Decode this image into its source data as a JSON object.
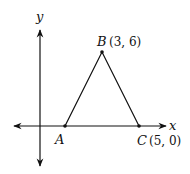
{
  "diagram": {
    "type": "coordinate-plane-triangle",
    "axes": {
      "x_label": "x",
      "y_label": "y"
    },
    "points": [
      {
        "name": "A",
        "coords_text": "",
        "px": 65,
        "py": 126
      },
      {
        "name": "B",
        "coords_text": "(3, 6)",
        "px": 102,
        "py": 52
      },
      {
        "name": "C",
        "coords_text": "(5, 0)",
        "px": 139,
        "py": 126
      }
    ],
    "colors": {
      "stroke": "#111111",
      "background": "#ffffff"
    }
  }
}
